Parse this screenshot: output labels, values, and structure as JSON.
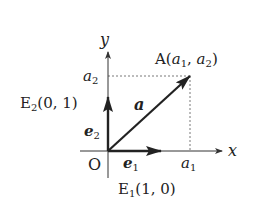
{
  "diagram": {
    "axes": {
      "x_label": "x",
      "y_label": "y",
      "origin_label": "O"
    },
    "point_A": {
      "name": "A",
      "coord_open": "(",
      "coord_a1": "a",
      "coord_a1_sub": "1",
      "coord_sep": ", ",
      "coord_a2": "a",
      "coord_a2_sub": "2",
      "coord_close": ")"
    },
    "tick_a1": {
      "base": "a",
      "sub": "1"
    },
    "tick_a2": {
      "base": "a",
      "sub": "2"
    },
    "vector_a": {
      "label": "a"
    },
    "vector_e1": {
      "base": "e",
      "sub": "1"
    },
    "vector_e2": {
      "base": "e",
      "sub": "2"
    },
    "point_E1": {
      "base": "E",
      "sub": "1",
      "coords": "(1, 0)"
    },
    "point_E2": {
      "base": "E",
      "sub": "2",
      "coords": "(0, 1)"
    },
    "colors": {
      "axis": "#333333",
      "vector": "#222222",
      "guide": "#555555"
    }
  }
}
